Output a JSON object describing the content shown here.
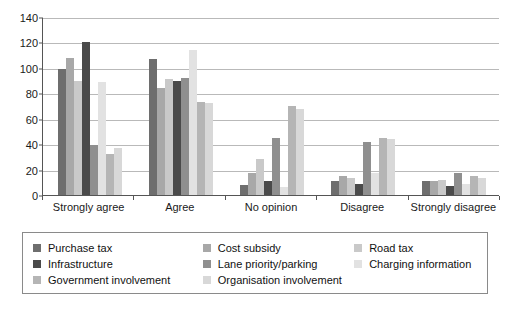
{
  "chart_data": {
    "type": "bar",
    "title": "",
    "subtitle": "",
    "xlabel": "",
    "ylabel": "",
    "ylim": [
      0,
      140
    ],
    "ytick_step": 20,
    "yticks": [
      0,
      20,
      40,
      60,
      80,
      100,
      120,
      140
    ],
    "grid": true,
    "legend_position": "bottom",
    "categories": [
      "Strongly agree",
      "Agree",
      "No opinion",
      "Disagree",
      "Strongly disagree"
    ],
    "series": [
      {
        "name": "Purchase tax",
        "color": "#6e6e6e",
        "values": [
          99,
          107,
          8,
          11,
          11
        ]
      },
      {
        "name": "Cost subsidy",
        "color": "#a8a8a8",
        "values": [
          108,
          84,
          17,
          15,
          11
        ]
      },
      {
        "name": "Road tax",
        "color": "#c9c9c9",
        "values": [
          90,
          91,
          28,
          13,
          12
        ]
      },
      {
        "name": "Infrastructure",
        "color": "#4a4a4a",
        "values": [
          120,
          90,
          11,
          9,
          7
        ]
      },
      {
        "name": "Lane priority/parking",
        "color": "#8f8f8f",
        "values": [
          39,
          92,
          45,
          42,
          17
        ]
      },
      {
        "name": "Charging information",
        "color": "#e2e2e2",
        "values": [
          89,
          114,
          6,
          17,
          9
        ]
      },
      {
        "name": "Government involvement",
        "color": "#b5b5b5",
        "values": [
          32,
          73,
          70,
          45,
          15
        ]
      },
      {
        "name": "Organisation involvement",
        "color": "#d8d8d8",
        "values": [
          37,
          72,
          68,
          44,
          13
        ]
      }
    ]
  },
  "legend": {
    "columns": [
      [
        {
          "label": "Purchase tax",
          "color": "#6e6e6e"
        },
        {
          "label": "Infrastructure",
          "color": "#4a4a4a"
        },
        {
          "label": "Government involvement",
          "color": "#b5b5b5"
        }
      ],
      [
        {
          "label": "Cost subsidy",
          "color": "#a8a8a8"
        },
        {
          "label": "Lane priority/parking",
          "color": "#8f8f8f"
        },
        {
          "label": "Organisation involvement",
          "color": "#d8d8d8"
        }
      ],
      [
        {
          "label": "Road tax",
          "color": "#c9c9c9"
        },
        {
          "label": "Charging information",
          "color": "#e2e2e2"
        }
      ]
    ]
  },
  "axis": {
    "y_tick_labels": [
      "140",
      "120",
      "100",
      "80",
      "60",
      "40",
      "20",
      "0"
    ]
  }
}
